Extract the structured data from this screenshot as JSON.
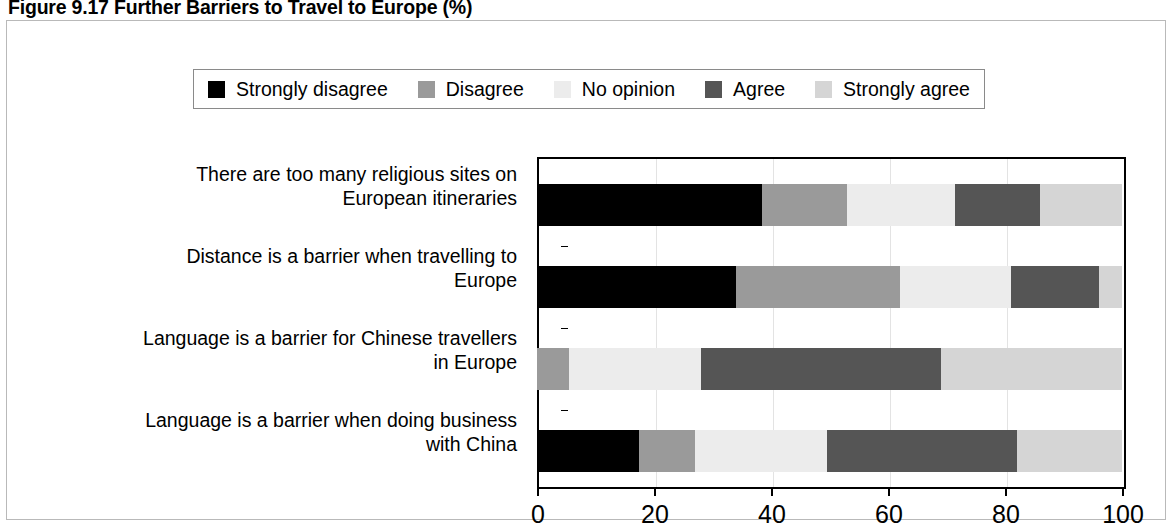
{
  "figure": {
    "caption": "Figure 9.17  Further Barriers to Travel to Europe (%)"
  },
  "legend": {
    "items": [
      {
        "label": "Strongly disagree",
        "color": "#000000"
      },
      {
        "label": "Disagree",
        "color": "#9a9a9a"
      },
      {
        "label": "No opinion",
        "color": "#ececec"
      },
      {
        "label": "Agree",
        "color": "#555555"
      },
      {
        "label": "Strongly agree",
        "color": "#d5d5d5"
      }
    ]
  },
  "axis": {
    "ticks": [
      "0",
      "20",
      "40",
      "60",
      "80",
      "100"
    ]
  },
  "categories": [
    "There are too many religious sites on European itineraries",
    "Distance is a barrier when travelling to Europe",
    "Language is a barrier for Chinese travellers in Europe",
    "Language is a barrier when doing business with China"
  ],
  "category_lines": [
    [
      "There are too many religious sites on",
      "European itineraries"
    ],
    [
      "Distance is a barrier when travelling to",
      "Europe"
    ],
    [
      "Language is a barrier for Chinese travellers",
      "in Europe"
    ],
    [
      "Language is a barrier when doing business",
      "with China"
    ]
  ],
  "chart_data": {
    "type": "bar",
    "orientation": "horizontal",
    "stacked": true,
    "title": "Figure 9.17  Further Barriers to Travel to Europe (%)",
    "xlabel": "",
    "ylabel": "",
    "xlim": [
      0,
      100
    ],
    "xticks": [
      0,
      20,
      40,
      60,
      80,
      100
    ],
    "grid": true,
    "legend_position": "top",
    "categories": [
      "There are too many religious sites on European itineraries",
      "Distance is a barrier when travelling to Europe",
      "Language is a barrier for Chinese travellers in Europe",
      "Language is a barrier when doing business with China"
    ],
    "series": [
      {
        "name": "Strongly disagree",
        "color": "#000000",
        "values": [
          38.5,
          34,
          0,
          17.5
        ]
      },
      {
        "name": "Disagree",
        "color": "#9a9a9a",
        "values": [
          14.5,
          28,
          5.5,
          9.5
        ]
      },
      {
        "name": "No opinion",
        "color": "#ececec",
        "values": [
          18.5,
          19,
          22.5,
          22.5
        ]
      },
      {
        "name": "Agree",
        "color": "#555555",
        "values": [
          14.5,
          15,
          41,
          32.5
        ]
      },
      {
        "name": "Strongly agree",
        "color": "#d5d5d5",
        "values": [
          14,
          4,
          31,
          18
        ]
      }
    ]
  }
}
